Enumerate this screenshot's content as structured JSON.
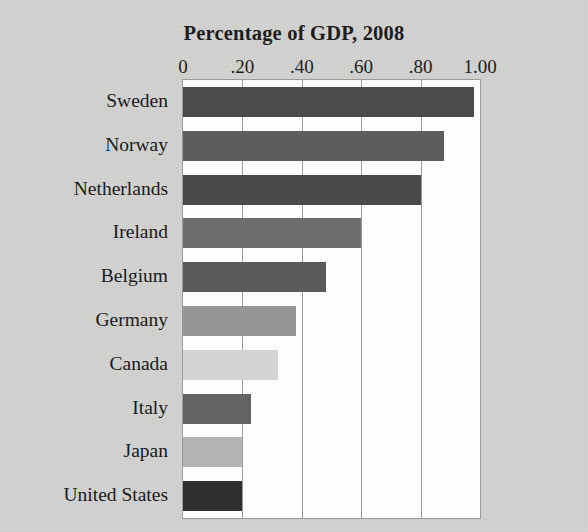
{
  "chart_data": {
    "type": "bar",
    "orientation": "horizontal",
    "title": "Percentage of GDP, 2008",
    "xlabel": "",
    "ylabel": "",
    "xlim": [
      0,
      1.0
    ],
    "xticks": [
      0,
      0.2,
      0.4,
      0.6,
      0.8,
      1.0
    ],
    "xticklabels": [
      "0",
      ".20",
      ".40",
      ".60",
      ".80",
      "1.00"
    ],
    "grid": true,
    "legend": "none",
    "categories": [
      "Sweden",
      "Norway",
      "Netherlands",
      "Ireland",
      "Belgium",
      "Germany",
      "Canada",
      "Italy",
      "Japan",
      "United States"
    ],
    "values": [
      0.98,
      0.88,
      0.8,
      0.6,
      0.48,
      0.38,
      0.32,
      0.23,
      0.2,
      0.2
    ],
    "bar_colors": [
      "#4b4b4b",
      "#5d5d5d",
      "#4a4a4a",
      "#6d6d6d",
      "#5a5a5a",
      "#969696",
      "#d4d4d4",
      "#636363",
      "#b3b3b3",
      "#2f2f2f"
    ]
  },
  "colors": {
    "page_background": "#d3d3d2",
    "plot_background": "#fdfdfd",
    "axis_line": "#9a9a9a",
    "text": "#1a1a1a"
  }
}
